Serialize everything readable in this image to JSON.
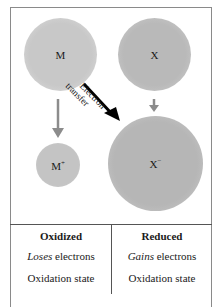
{
  "diagram": {
    "atoms": {
      "m": {
        "label": "M"
      },
      "x": {
        "label": "X"
      },
      "m_ion": {
        "base": "M",
        "charge": "+"
      },
      "x_ion": {
        "base": "X",
        "charge": "−"
      }
    },
    "arrow_label": {
      "line1": "Electron",
      "line2": "transfer"
    },
    "colors": {
      "arrow_gray": "#8c8c8c",
      "arrow_black": "#000000",
      "border": "#8a8a8a"
    }
  },
  "table": {
    "left": {
      "header": "Oxidized",
      "row1_emph": "Loses",
      "row1_rest": " electrons",
      "row2": "Oxidation state"
    },
    "right": {
      "header": "Reduced",
      "row1_emph": "Gains",
      "row1_rest": " electrons",
      "row2": "Oxidation state"
    }
  }
}
